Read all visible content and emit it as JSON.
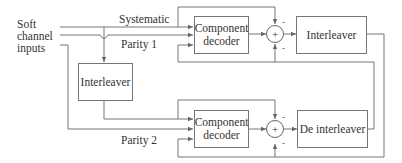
{
  "diagram": {
    "inputs_label": [
      "Soft",
      "channel",
      "inputs"
    ],
    "signals": {
      "systematic": "Systematic",
      "parity1": "Parity 1",
      "parity2": "Parity 2"
    },
    "blocks": {
      "interleaver_left": "Interleaver",
      "decoder_top": [
        "Component",
        "decoder"
      ],
      "interleaver_right": "Interleaver",
      "decoder_bottom": [
        "Component",
        "decoder"
      ],
      "deinterleaver": "De interleaver"
    },
    "summers": {
      "top": {
        "symbol": "+",
        "sign_in_top": "-",
        "sign_in_bottom": "-"
      },
      "bottom": {
        "symbol": "+",
        "sign_in_top": "-",
        "sign_in_bottom": "-"
      }
    }
  }
}
